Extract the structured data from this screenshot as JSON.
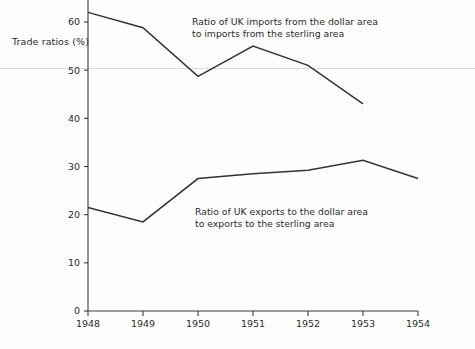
{
  "chart_data": {
    "type": "line",
    "title": "",
    "xlabel": "",
    "ylabel": "Trade ratios (%)",
    "x": [
      1948,
      1949,
      1950,
      1951,
      1952,
      1953,
      1954
    ],
    "xtick_labels": [
      "1948",
      "1949",
      "1950",
      "1951",
      "1952",
      "1953",
      "1954"
    ],
    "ytick_labels": [
      "0",
      "10",
      "20",
      "30",
      "40",
      "50",
      "60"
    ],
    "yticks": [
      0,
      10,
      20,
      30,
      40,
      50,
      60
    ],
    "ylim": [
      0,
      65
    ],
    "xlim": [
      1948,
      1954
    ],
    "grid": false,
    "legend_position": "inline-annotations",
    "series": [
      {
        "name": "Ratio of UK imports from the dollar area to imports from the sterling area",
        "x": [
          1948,
          1949,
          1950,
          1951,
          1952,
          1953
        ],
        "values": [
          62.0,
          58.8,
          48.7,
          55.0,
          51.0,
          43.0
        ],
        "annotation_line1": "Ratio of UK imports from the dollar area",
        "annotation_line2": "to imports from the sterling area"
      },
      {
        "name": "Ratio of UK exports to the dollar area to exports to the sterling area",
        "x": [
          1948,
          1949,
          1950,
          1951,
          1952,
          1953,
          1954
        ],
        "values": [
          21.5,
          18.5,
          27.5,
          28.5,
          29.2,
          31.3,
          27.5
        ],
        "annotation_line1": "Ratio of UK exports to the dollar area",
        "annotation_line2": "to exports to the sterling area"
      }
    ],
    "colors": {
      "line": "#333333",
      "axis": "#3a3a3a",
      "text": "#2b2b2b",
      "background": "#fefefe"
    }
  },
  "axis": {
    "ylabel": "Trade ratios (%)"
  },
  "caption": {
    "text": ""
  }
}
